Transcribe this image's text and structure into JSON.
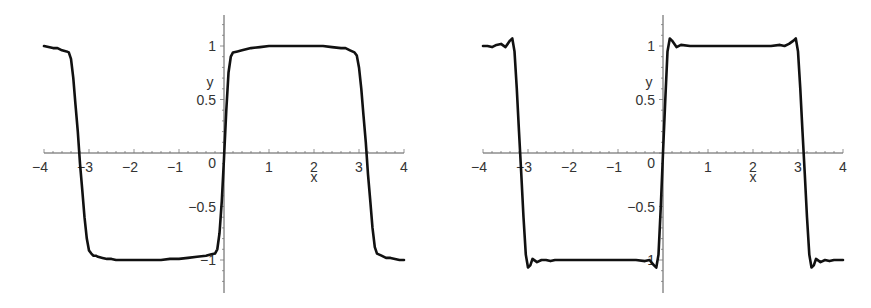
{
  "chart_data": [
    {
      "type": "line",
      "name": "smoothed-fourier-square-wave",
      "xlabel": "x",
      "ylabel": "y",
      "xlim": [
        -4,
        4
      ],
      "ylim": [
        -1.3,
        1.3
      ],
      "x_ticks": [
        -4,
        -3,
        -2,
        -1,
        1,
        2,
        3,
        4
      ],
      "x_tick_labels": [
        "−4",
        "−3",
        "−2",
        "−1",
        "1",
        "2",
        "3",
        "4"
      ],
      "y_ticks": [
        1,
        0.5,
        -0.5,
        -1
      ],
      "y_tick_labels": [
        "1",
        "0.5",
        "−0.5",
        "−1"
      ],
      "origin_label": "0",
      "grid": false,
      "x": [
        -4.0,
        -3.9,
        -3.8,
        -3.7,
        -3.6,
        -3.5,
        -3.45,
        -3.4,
        -3.35,
        -3.3,
        -3.25,
        -3.2,
        -3.15,
        -3.1,
        -3.05,
        -3.0,
        -2.95,
        -2.9,
        -2.85,
        -2.8,
        -2.7,
        -2.6,
        -2.5,
        -2.4,
        -2.2,
        -2.0,
        -1.8,
        -1.6,
        -1.4,
        -1.2,
        -1.0,
        -0.8,
        -0.6,
        -0.4,
        -0.3,
        -0.2,
        -0.15,
        -0.1,
        -0.05,
        0.0,
        0.05,
        0.1,
        0.15,
        0.2,
        0.3,
        0.4,
        0.6,
        0.8,
        1.0,
        1.2,
        1.4,
        1.6,
        1.8,
        2.0,
        2.2,
        2.4,
        2.6,
        2.7,
        2.8,
        2.85,
        2.9,
        2.95,
        3.0,
        3.05,
        3.1,
        3.15,
        3.2,
        3.25,
        3.3,
        3.35,
        3.4,
        3.45,
        3.5,
        3.6,
        3.7,
        3.8,
        3.9,
        4.0
      ],
      "values": [
        1.0,
        0.99,
        0.98,
        0.98,
        0.96,
        0.95,
        0.94,
        0.88,
        0.7,
        0.45,
        0.2,
        -0.1,
        -0.35,
        -0.6,
        -0.8,
        -0.91,
        -0.94,
        -0.96,
        -0.96,
        -0.97,
        -0.98,
        -0.99,
        -0.99,
        -1.0,
        -1.0,
        -1.0,
        -1.0,
        -1.0,
        -1.0,
        -0.99,
        -0.99,
        -0.98,
        -0.97,
        -0.96,
        -0.95,
        -0.94,
        -0.9,
        -0.75,
        -0.45,
        -0.05,
        0.4,
        0.75,
        0.9,
        0.94,
        0.95,
        0.96,
        0.98,
        0.99,
        1.0,
        1.0,
        1.0,
        1.0,
        1.0,
        1.0,
        1.0,
        0.99,
        0.98,
        0.98,
        0.96,
        0.95,
        0.94,
        0.91,
        0.8,
        0.6,
        0.35,
        0.1,
        -0.2,
        -0.45,
        -0.7,
        -0.88,
        -0.94,
        -0.95,
        -0.96,
        -0.98,
        -0.98,
        -0.99,
        -1.0,
        -1.0
      ]
    },
    {
      "type": "line",
      "name": "fourier-partial-sum-square-wave",
      "xlabel": "x",
      "ylabel": "y",
      "xlim": [
        -4,
        4
      ],
      "ylim": [
        -1.3,
        1.3
      ],
      "x_ticks": [
        -4,
        -3,
        -2,
        -1,
        1,
        2,
        3,
        4
      ],
      "x_tick_labels": [
        "−4",
        "−3",
        "−2",
        "−1",
        "1",
        "2",
        "3",
        "4"
      ],
      "y_ticks": [
        1,
        0.5,
        -0.5,
        -1
      ],
      "y_tick_labels": [
        "1",
        "0.5",
        "−0.5",
        "−1"
      ],
      "origin_label": "0",
      "grid": false,
      "x": [
        -4.0,
        -3.9,
        -3.8,
        -3.7,
        -3.6,
        -3.5,
        -3.4,
        -3.35,
        -3.3,
        -3.25,
        -3.2,
        -3.15,
        -3.1,
        -3.05,
        -3.0,
        -2.95,
        -2.9,
        -2.8,
        -2.7,
        -2.6,
        -2.5,
        -2.4,
        -2.2,
        -2.0,
        -1.8,
        -1.6,
        -1.4,
        -1.2,
        -1.0,
        -0.8,
        -0.6,
        -0.4,
        -0.3,
        -0.2,
        -0.15,
        -0.1,
        -0.05,
        0.0,
        0.05,
        0.1,
        0.15,
        0.2,
        0.3,
        0.4,
        0.6,
        0.8,
        1.0,
        1.2,
        1.4,
        1.6,
        1.8,
        2.0,
        2.2,
        2.4,
        2.6,
        2.7,
        2.8,
        2.9,
        2.95,
        3.0,
        3.05,
        3.1,
        3.15,
        3.2,
        3.25,
        3.3,
        3.35,
        3.4,
        3.5,
        3.6,
        3.7,
        3.8,
        3.9,
        4.0
      ],
      "values": [
        1.0,
        1.0,
        0.99,
        1.01,
        1.02,
        0.99,
        1.05,
        1.07,
        0.95,
        0.6,
        0.2,
        -0.2,
        -0.6,
        -0.95,
        -1.07,
        -1.05,
        -0.99,
        -1.02,
        -1.0,
        -1.0,
        -1.01,
        -1.0,
        -1.0,
        -1.0,
        -1.0,
        -1.0,
        -1.0,
        -1.0,
        -1.0,
        -1.0,
        -1.0,
        -1.01,
        -1.0,
        -1.05,
        -1.07,
        -0.95,
        -0.5,
        0.0,
        0.5,
        0.95,
        1.07,
        1.05,
        0.99,
        1.01,
        1.0,
        1.0,
        1.0,
        1.0,
        1.0,
        1.0,
        1.0,
        1.0,
        1.0,
        1.0,
        1.01,
        1.0,
        1.02,
        1.05,
        1.07,
        0.95,
        0.6,
        0.2,
        -0.2,
        -0.6,
        -0.95,
        -1.07,
        -1.05,
        -0.99,
        -1.02,
        -1.0,
        -1.01,
        -1.0,
        -1.0,
        -1.0
      ]
    }
  ]
}
